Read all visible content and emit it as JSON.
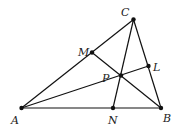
{
  "diagram": {
    "type": "triangle-cevians",
    "points": {
      "A": {
        "x": 21.5,
        "y": 108,
        "label": "A",
        "lx": 11,
        "ly": 124
      },
      "B": {
        "x": 161,
        "y": 108,
        "label": "B",
        "lx": 163,
        "ly": 122
      },
      "C": {
        "x": 133.5,
        "y": 19.5,
        "label": "C",
        "lx": 121,
        "ly": 16
      },
      "M": {
        "x": 92,
        "y": 52.5,
        "label": "M",
        "lx": 78,
        "ly": 56
      },
      "L": {
        "x": 148.5,
        "y": 66,
        "label": "L",
        "lx": 153,
        "ly": 71
      },
      "N": {
        "x": 113,
        "y": 108,
        "label": "N",
        "lx": 108,
        "ly": 124
      },
      "P": {
        "x": 121,
        "y": 75.5,
        "label": "P",
        "lx": 102,
        "ly": 82
      }
    },
    "segments": [
      [
        "A",
        "B"
      ],
      [
        "B",
        "C"
      ],
      [
        "C",
        "A"
      ],
      [
        "A",
        "L"
      ],
      [
        "B",
        "M"
      ],
      [
        "C",
        "N"
      ]
    ]
  }
}
